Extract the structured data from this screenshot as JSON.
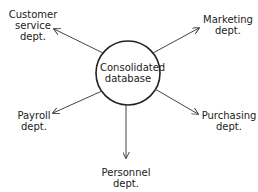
{
  "diagram": {
    "center": {
      "line1": "Consolidated",
      "line2": "database"
    },
    "nodes": [
      {
        "id": "customer",
        "line1": "Customer",
        "line2": "service",
        "line3": "dept."
      },
      {
        "id": "marketing",
        "line1": "Marketing",
        "line2": "dept."
      },
      {
        "id": "payroll",
        "line1": "Payroll",
        "line2": "dept."
      },
      {
        "id": "purchasing",
        "line1": "Purchasing",
        "line2": "dept."
      },
      {
        "id": "personnel",
        "line1": "Personnel",
        "line2": "dept."
      }
    ],
    "stroke_color": "#333333"
  }
}
